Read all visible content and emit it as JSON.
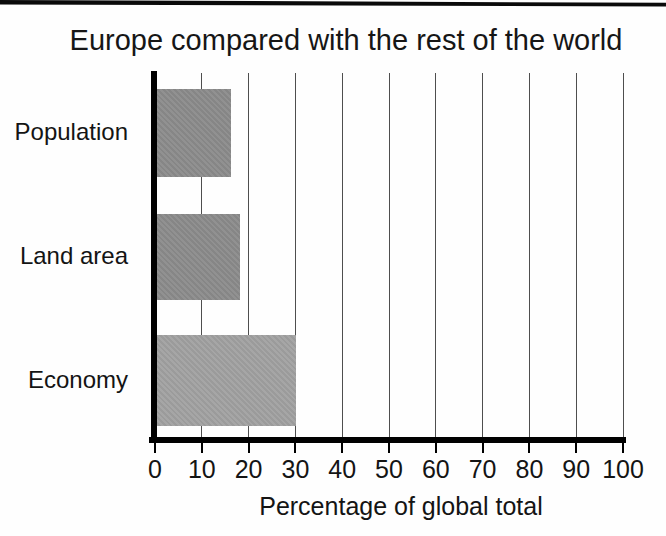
{
  "chart_data": {
    "type": "bar",
    "orientation": "horizontal",
    "title": "Europe compared with the rest of the world",
    "categories": [
      "Population",
      "Land area",
      "Economy"
    ],
    "values": [
      16,
      18,
      30
    ],
    "xlabel": "Percentage of global total",
    "xlim": [
      0,
      100
    ],
    "xticks": [
      0,
      10,
      20,
      30,
      40,
      50,
      60,
      70,
      80,
      90,
      100
    ],
    "grid": "vertical gridlines at every 10 percent",
    "legend": "none",
    "bar_colors": [
      "#8b8b8b",
      "#8b8b8b",
      "#a0a0a0"
    ],
    "axis_color": "#000000",
    "gridline_color": "#4e4e4e",
    "text_color": "#141414",
    "background_color": "#fefefe"
  }
}
